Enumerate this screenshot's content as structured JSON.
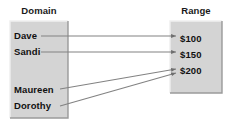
{
  "diagram": {
    "type": "mapping-diagram",
    "title_left": "Domain",
    "title_right": "Range",
    "colors": {
      "box_fill": "#d4d4d4",
      "box_border_light": "#f2f2f2",
      "box_border_dark": "#9a9a9a",
      "arrow": "#777777",
      "text": "#111111",
      "background": "#ffffff"
    },
    "domain": {
      "label": "Domain",
      "items": [
        {
          "id": "dave",
          "label": "Dave"
        },
        {
          "id": "sandi",
          "label": "Sandi"
        },
        {
          "id": "maureen",
          "label": "Maureen"
        },
        {
          "id": "dorothy",
          "label": "Dorothy"
        }
      ]
    },
    "range": {
      "label": "Range",
      "items": [
        {
          "id": "v100",
          "label": "$100"
        },
        {
          "id": "v150",
          "label": "$150"
        },
        {
          "id": "v200",
          "label": "$200"
        }
      ]
    },
    "mappings": [
      {
        "from": "Dave",
        "to": "$100"
      },
      {
        "from": "Sandi",
        "to": "$150"
      },
      {
        "from": "Maureen",
        "to": "$200"
      },
      {
        "from": "Dorothy",
        "to": "$200"
      }
    ]
  }
}
